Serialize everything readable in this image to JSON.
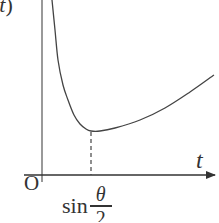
{
  "chart_data": {
    "type": "line",
    "title": "",
    "ylabel": "f(t)",
    "ylabel_visible": "(t)",
    "xlabel": "t",
    "origin_label": "O",
    "x_ticks": [
      {
        "position": "sin(θ/2)",
        "label_function": "sin",
        "label_numerator": "θ",
        "label_denominator": "2"
      }
    ],
    "series": [
      {
        "name": "f(t)",
        "shape": "decreasing from +infinity near t=0 to a minimum at t = sin(θ/2), then increasing",
        "points_px": [
          [
            52,
            0
          ],
          [
            55,
            30
          ],
          [
            58,
            60
          ],
          [
            63,
            85
          ],
          [
            68,
            100
          ],
          [
            74,
            115
          ],
          [
            80,
            124
          ],
          [
            86,
            129
          ],
          [
            91,
            131
          ],
          [
            100,
            131
          ],
          [
            115,
            128
          ],
          [
            140,
            120
          ],
          [
            165,
            108
          ],
          [
            190,
            92
          ],
          [
            214,
            75
          ]
        ],
        "minimum_at": "sin(θ/2)"
      }
    ],
    "annotations": [
      {
        "type": "dashed-vertical-line",
        "at": "sin(θ/2)",
        "from": "minimum",
        "to": "x-axis"
      }
    ],
    "grid": false,
    "legend": null
  },
  "labels": {
    "y_axis_visible": "(t)",
    "y_axis_var": "t",
    "x_axis": "t",
    "origin": "O",
    "tick_fn": "sin",
    "tick_num": "θ",
    "tick_den": "2"
  },
  "colors": {
    "axis": "#333333",
    "curve": "#444444",
    "background": "#ffffff"
  }
}
